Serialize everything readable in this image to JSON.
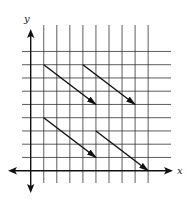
{
  "diagram": {
    "type": "coordinate-grid-vectors",
    "axes": {
      "x_label": "x",
      "y_label": "y",
      "x_grid_lines": 10,
      "y_grid_lines": 10
    },
    "vectors": [
      {
        "id": "vector-1",
        "from": [
          1,
          8
        ],
        "to": [
          5,
          5
        ]
      },
      {
        "id": "vector-2",
        "from": [
          4,
          8
        ],
        "to": [
          8,
          5
        ]
      },
      {
        "id": "vector-3",
        "from": [
          1,
          4
        ],
        "to": [
          5,
          1
        ]
      },
      {
        "id": "vector-4",
        "from": [
          5,
          3
        ],
        "to": [
          9,
          0
        ]
      }
    ],
    "colors": {
      "grid": "#333333",
      "axis": "#111111",
      "vector": "#111111"
    }
  }
}
